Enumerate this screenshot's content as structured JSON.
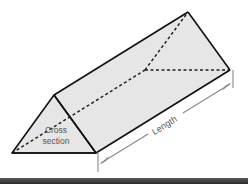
{
  "diagram": {
    "type": "triangular-prism",
    "labels": {
      "cross_section_line1": "Cross",
      "cross_section_line2": "section",
      "length": "Length"
    },
    "colors": {
      "face_fill": "#e6e6e6",
      "edge": "#111111",
      "hidden_edge": "#222222",
      "dimension_arrow": "#888888",
      "label_text": "#555555",
      "bottom_band": "#3a3a3a"
    }
  }
}
